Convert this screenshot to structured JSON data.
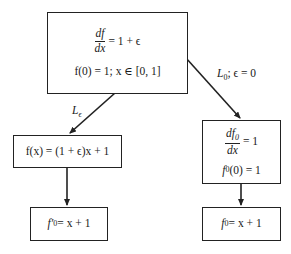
{
  "diagram": {
    "top_box": {
      "frac_num": "df",
      "frac_den": "dx",
      "eq_rhs": "= 1 + ϵ",
      "line2": "f(0) = 1;  x ∈ [0, 1]"
    },
    "left_mid_box": {
      "text": "f(x) = (1 + ϵ)x + 1"
    },
    "left_bottom_box": {
      "lhs": "f′",
      "sub": "0",
      "rhs": " = x + 1"
    },
    "right_mid_box": {
      "frac_num": "df",
      "frac_num_sub": "0",
      "frac_den": "dx",
      "eq_rhs": "= 1",
      "line2_lhs": "f",
      "line2_sub": "0",
      "line2_rhs": "(0) = 1"
    },
    "right_bottom_box": {
      "lhs": "f",
      "sub": "0",
      "rhs": " = x + 1"
    },
    "labels": {
      "left_arrow_L": "L",
      "left_arrow_sub": "ϵ",
      "right_arrow_L": "L",
      "right_arrow_sub": "0",
      "right_arrow_rest": "; ϵ = 0"
    },
    "colors": {
      "line": "#222222",
      "background": "#ffffff"
    }
  }
}
